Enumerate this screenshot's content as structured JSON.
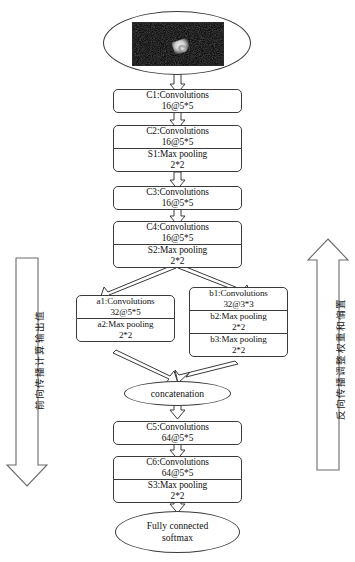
{
  "diagram": {
    "input": {
      "name": "input-image",
      "alt_label": "noisy grayscale target image"
    },
    "side_labels": {
      "left": "前向传播计算输出值",
      "right": "反向传播调整权重和偏置"
    },
    "nodes": [
      {
        "id": "c1",
        "line1": "C1:Convolutions",
        "line2": "16@5*5"
      },
      {
        "id": "c2",
        "line1": "C2:Convolutions",
        "line2": "16@5*5"
      },
      {
        "id": "s1",
        "line1": "S1:Max pooling",
        "line2": "2*2"
      },
      {
        "id": "c3",
        "line1": "C3:Convolutions",
        "line2": "16@5*5"
      },
      {
        "id": "c4",
        "line1": "C4:Convolutions",
        "line2": "16@5*5"
      },
      {
        "id": "s2",
        "line1": "S2:Max pooling",
        "line2": "2*2"
      },
      {
        "id": "a1",
        "line1": "a1:Convolutions",
        "line2": "32@5*5"
      },
      {
        "id": "a2",
        "line1": "a2:Max pooling",
        "line2": "2*2"
      },
      {
        "id": "b1",
        "line1": "b1:Convolutions",
        "line2": "32@3*3"
      },
      {
        "id": "b2",
        "line1": "b2:Max pooling",
        "line2": "2*2"
      },
      {
        "id": "b3",
        "line1": "b3:Max pooling",
        "line2": "2*2"
      },
      {
        "id": "c5",
        "line1": "C5:Convolutions",
        "line2": "64@5*5"
      },
      {
        "id": "c6",
        "line1": "C6:Convolutions",
        "line2": "64@5*5"
      },
      {
        "id": "s3",
        "line1": "S3:Max pooling",
        "line2": "2*2"
      }
    ],
    "ellipses": [
      {
        "id": "concat",
        "line1": "concatenation",
        "line2": ""
      },
      {
        "id": "output",
        "line1": "Fully connected",
        "line2": "softmax"
      }
    ],
    "colors": {
      "stroke": "#3a3a3a",
      "fill": "#ffffff",
      "text": "#111111",
      "image_bg": "#0d0d0d"
    }
  }
}
